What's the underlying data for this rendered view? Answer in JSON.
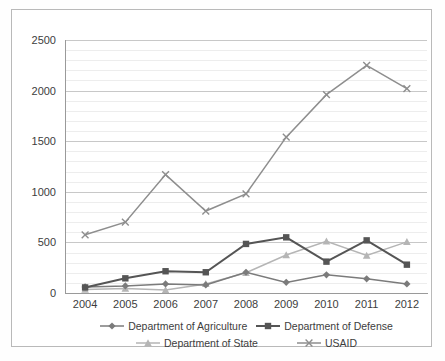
{
  "chart_data": {
    "type": "line",
    "title": "",
    "subtitle": "",
    "xlabel": "",
    "ylabel": "",
    "categories": [
      "2004",
      "2005",
      "2006",
      "2007",
      "2008",
      "2009",
      "2010",
      "2011",
      "2012"
    ],
    "ylim": [
      0,
      2500
    ],
    "yticks": [
      0,
      500,
      1000,
      1500,
      2000,
      2500
    ],
    "ytick_labels": [
      "0",
      "500",
      "1000",
      "1500",
      "2000",
      "2500"
    ],
    "minor_gridlines": true,
    "minor_tick_step": 100,
    "grid": true,
    "legend_position": "bottom",
    "series": [
      {
        "name": "Department of Agriculture",
        "marker": "diamond",
        "color": "#7b7b7b",
        "values": [
          60,
          70,
          90,
          80,
          205,
          105,
          180,
          140,
          90
        ]
      },
      {
        "name": "Department of Defense",
        "marker": "square",
        "color": "#555555",
        "values": [
          55,
          145,
          215,
          205,
          485,
          550,
          310,
          520,
          280
        ]
      },
      {
        "name": "Department of State",
        "marker": "triangle",
        "color": "#b5b5b5",
        "values": [
          35,
          45,
          30,
          90,
          200,
          375,
          510,
          370,
          505
        ]
      },
      {
        "name": "USAID",
        "marker": "x",
        "color": "#8e8e8e",
        "values": [
          575,
          700,
          1170,
          810,
          980,
          1540,
          1960,
          2250,
          2020
        ]
      }
    ]
  },
  "legend": {
    "items": [
      {
        "label": "Department of Agriculture",
        "marker": "diamond",
        "color": "#7b7b7b"
      },
      {
        "label": "Department of Defense",
        "marker": "square",
        "color": "#555555"
      },
      {
        "label": "Department of State",
        "marker": "triangle",
        "color": "#b5b5b5"
      },
      {
        "label": "USAID",
        "marker": "x",
        "color": "#8e8e8e"
      }
    ]
  }
}
